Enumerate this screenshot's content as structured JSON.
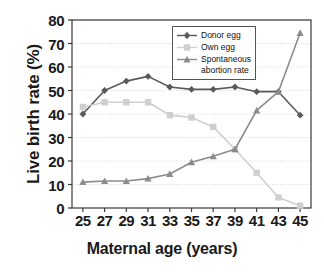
{
  "chart_data": {
    "type": "line",
    "title": "",
    "xlabel": "Maternal age (years)",
    "ylabel": "Live birth rate (%)",
    "x": [
      25,
      26,
      27,
      28,
      29,
      30,
      31,
      32,
      33,
      34,
      35,
      36,
      37,
      38,
      39,
      40,
      41,
      42,
      43,
      44,
      45
    ],
    "xticks": [
      25,
      27,
      29,
      31,
      33,
      35,
      37,
      39,
      41,
      43,
      45
    ],
    "yticks": [
      0,
      10,
      20,
      30,
      40,
      50,
      60,
      70,
      80
    ],
    "xlim": [
      24,
      46
    ],
    "ylim": [
      0,
      80
    ],
    "grid": true,
    "legend_position": "top-right",
    "series": [
      {
        "name": "Donor egg",
        "marker": "diamond",
        "color": "#5a5a5a",
        "x": [
          25,
          27,
          29,
          31,
          33,
          35,
          37,
          39,
          41,
          43,
          45
        ],
        "values": [
          40,
          50,
          54,
          56,
          51.5,
          50.5,
          50.5,
          51.5,
          49.5,
          49.5,
          39.5
        ]
      },
      {
        "name": "Own egg",
        "marker": "square",
        "color": "#cfcfcf",
        "x": [
          25,
          27,
          29,
          31,
          33,
          35,
          37,
          39,
          41,
          43,
          45
        ],
        "values": [
          43,
          45,
          45,
          45,
          39.5,
          38.5,
          34.5,
          25,
          15,
          4.5,
          1
        ]
      },
      {
        "name": "Spontaneous\nabortion rate",
        "marker": "triangle",
        "color": "#8c8c8c",
        "x": [
          25,
          27,
          29,
          31,
          33,
          35,
          37,
          39,
          41,
          43,
          45
        ],
        "values": [
          11,
          11.5,
          11.5,
          12.5,
          14.5,
          19.5,
          22,
          25,
          41.5,
          49.5,
          74.5
        ]
      }
    ]
  },
  "legend": {
    "items": [
      {
        "label": "Donor egg"
      },
      {
        "label": "Own egg"
      },
      {
        "label": "Spontaneous\nabortion rate"
      }
    ]
  },
  "axes": {
    "y_title": "Live birth rate (%)",
    "x_title": "Maternal age (years)",
    "y_tick_labels": [
      "80",
      "70",
      "60",
      "50",
      "40",
      "30",
      "20",
      "10",
      "0"
    ],
    "x_tick_labels": [
      "25",
      "27",
      "29",
      "31",
      "33",
      "35",
      "37",
      "39",
      "41",
      "43",
      "45"
    ]
  },
  "colors": {
    "donor_egg": "#5a5a5a",
    "own_egg": "#cfcfcf",
    "spontaneous": "#8c8c8c",
    "axis": "#3a3a3a",
    "grid": "#d9d9d9",
    "text": "#1a1a1a"
  }
}
